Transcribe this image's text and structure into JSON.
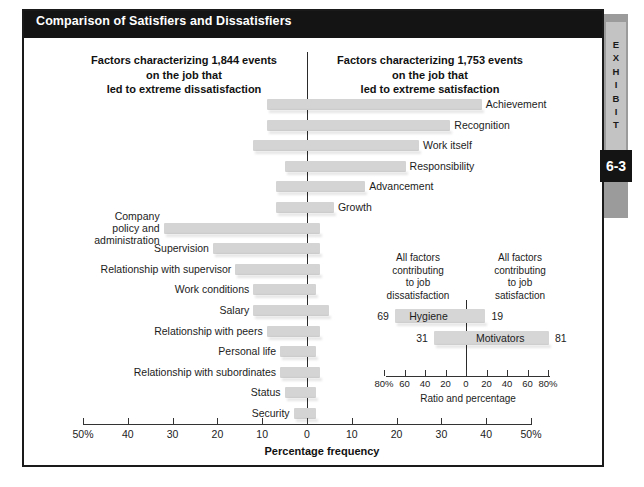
{
  "exhibit": {
    "tab_word": "EXHIBIT",
    "number": "6-3"
  },
  "header": {
    "title": "Comparison of Satisfiers and Dissatisfiers"
  },
  "columns": {
    "left_heading": "Factors characterizing 1,844 events\non the job that\nled to extreme dissatisfaction",
    "right_heading": "Factors characterizing 1,753 events\non the job that\nled to extreme satisfaction"
  },
  "chart_data": {
    "type": "bar",
    "title": "Comparison of Satisfiers and Dissatisfiers",
    "subtitle": "Herzberg Two-Factor Theory",
    "orientation": "horizontal-diverging",
    "xlabel": "Percentage frequency",
    "ylabel": "",
    "xlim": [
      -50,
      50
    ],
    "xticks": [
      -50,
      -40,
      -30,
      -20,
      -10,
      0,
      10,
      20,
      30,
      40,
      50
    ],
    "xticklabels": [
      "50%",
      "40",
      "30",
      "20",
      "10",
      "0",
      "10",
      "20",
      "30",
      "40",
      "50%"
    ],
    "grid": false,
    "legend_position": "none",
    "series": [
      {
        "name": "Percentage leading to extreme dissatisfaction",
        "direction": "left"
      },
      {
        "name": "Percentage leading to extreme satisfaction",
        "direction": "right"
      }
    ],
    "categories": [
      "Achievement",
      "Recognition",
      "Work itself",
      "Responsibility",
      "Advancement",
      "Growth",
      "Company policy and administration",
      "Supervision",
      "Relationship with supervisor",
      "Work conditions",
      "Salary",
      "Relationship with peers",
      "Personal life",
      "Relationship with subordinates",
      "Status",
      "Security"
    ],
    "points": [
      {
        "category": "Achievement",
        "label": "Achievement",
        "side": "right",
        "dissatisfaction": 9,
        "satisfaction": 39
      },
      {
        "category": "Recognition",
        "label": "Recognition",
        "side": "right",
        "dissatisfaction": 9,
        "satisfaction": 32
      },
      {
        "category": "Work itself",
        "label": "Work itself",
        "side": "right",
        "dissatisfaction": 12,
        "satisfaction": 25
      },
      {
        "category": "Responsibility",
        "label": "Responsibility",
        "side": "right",
        "dissatisfaction": 5,
        "satisfaction": 22
      },
      {
        "category": "Advancement",
        "label": "Advancement",
        "side": "right",
        "dissatisfaction": 7,
        "satisfaction": 13
      },
      {
        "category": "Growth",
        "label": "Growth",
        "side": "right",
        "dissatisfaction": 7,
        "satisfaction": 6
      },
      {
        "category": "Company policy and administration",
        "label": "Company\npolicy and\nadministration",
        "side": "left",
        "dissatisfaction": 32,
        "satisfaction": 3
      },
      {
        "category": "Supervision",
        "label": "Supervision",
        "side": "left",
        "dissatisfaction": 21,
        "satisfaction": 3
      },
      {
        "category": "Relationship with supervisor",
        "label": "Relationship with supervisor",
        "side": "left",
        "dissatisfaction": 16,
        "satisfaction": 3
      },
      {
        "category": "Work conditions",
        "label": "Work conditions",
        "side": "left",
        "dissatisfaction": 12,
        "satisfaction": 2
      },
      {
        "category": "Salary",
        "label": "Salary",
        "side": "left",
        "dissatisfaction": 12,
        "satisfaction": 5
      },
      {
        "category": "Relationship with peers",
        "label": "Relationship with peers",
        "side": "left",
        "dissatisfaction": 9,
        "satisfaction": 3
      },
      {
        "category": "Personal life",
        "label": "Personal life",
        "side": "left",
        "dissatisfaction": 6,
        "satisfaction": 2
      },
      {
        "category": "Relationship with subordinates",
        "label": "Relationship with subordinates",
        "side": "left",
        "dissatisfaction": 6,
        "satisfaction": 3
      },
      {
        "category": "Status",
        "label": "Status",
        "side": "left",
        "dissatisfaction": 5,
        "satisfaction": 2
      },
      {
        "category": "Security",
        "label": "Security",
        "side": "left",
        "dissatisfaction": 3,
        "satisfaction": 2
      }
    ],
    "inset": {
      "type": "bar",
      "orientation": "horizontal-diverging",
      "xlabel": "Ratio and percentage",
      "xlim": [
        -80,
        80
      ],
      "xticks": [
        -80,
        -60,
        -40,
        -20,
        0,
        20,
        40,
        60,
        80
      ],
      "xticklabels": [
        "80%",
        "60",
        "40",
        "20",
        "0",
        "20",
        "40",
        "60",
        "80%"
      ],
      "left_heading": "All factors\ncontributing\nto job\ndissatisfaction",
      "right_heading": "All factors\ncontributing\nto job\nsatisfaction",
      "rows": [
        {
          "name": "Hygiene",
          "left_value": 69,
          "right_value": 19
        },
        {
          "name": "Motivators",
          "left_value": 31,
          "right_value": 81
        }
      ]
    }
  },
  "colors": {
    "header_bar": "#141414",
    "bar_fill": "#d4d4d4",
    "frame_border": "#1a1a1a",
    "tab_strip": "#9b9b9b",
    "tab_inner": "#c3c3c3",
    "text": "#1c1c1c"
  }
}
